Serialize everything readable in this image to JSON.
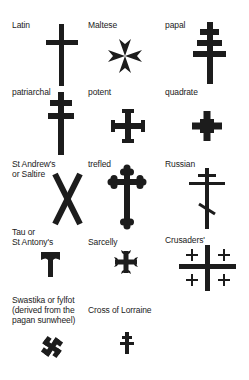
{
  "crosses": [
    {
      "name": "latin",
      "label_lines": [
        "Latin"
      ],
      "icon": "latin-cross-icon"
    },
    {
      "name": "maltese",
      "label_lines": [
        "Maltese"
      ],
      "icon": "maltese-cross-icon"
    },
    {
      "name": "papal",
      "label_lines": [
        "papal"
      ],
      "icon": "papal-cross-icon"
    },
    {
      "name": "patriarchal",
      "label_lines": [
        "patriarchal"
      ],
      "icon": "patriarchal-cross-icon"
    },
    {
      "name": "potent",
      "label_lines": [
        "potent"
      ],
      "icon": "potent-cross-icon"
    },
    {
      "name": "quadrate",
      "label_lines": [
        "quadrate"
      ],
      "icon": "quadrate-cross-icon"
    },
    {
      "name": "saltire",
      "label_lines": [
        "St Andrew's",
        "or Saltire"
      ],
      "icon": "saltire-cross-icon"
    },
    {
      "name": "trefled",
      "label_lines": [
        "trefled"
      ],
      "icon": "trefled-cross-icon"
    },
    {
      "name": "russian",
      "label_lines": [
        "Russian"
      ],
      "icon": "russian-cross-icon"
    },
    {
      "name": "tau",
      "label_lines": [
        "Tau or",
        "St Antony's"
      ],
      "icon": "tau-cross-icon"
    },
    {
      "name": "sarcelly",
      "label_lines": [
        "Sarcelly"
      ],
      "icon": "sarcelly-cross-icon"
    },
    {
      "name": "crusaders",
      "label_lines": [
        "Crusaders'"
      ],
      "icon": "crusaders-cross-icon"
    },
    {
      "name": "swastika",
      "label_lines": [
        "Swastika or fylfot",
        "(derived from the",
        "pagan sunwheel)"
      ],
      "icon": "swastika-icon"
    },
    {
      "name": "lorraine",
      "label_lines": [
        "Cross of Lorraine"
      ],
      "icon": "lorraine-cross-icon"
    }
  ],
  "colors": {
    "ink": "#1c1c1c",
    "background": "#ffffff"
  }
}
